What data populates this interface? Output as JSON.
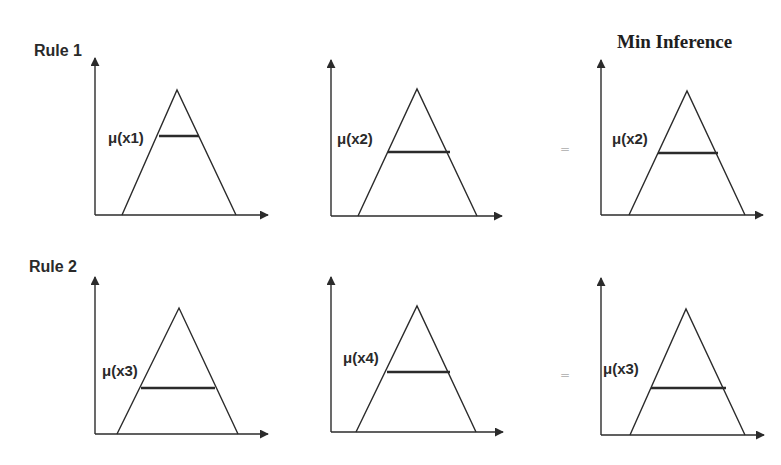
{
  "title": "Min Inference",
  "rules": [
    {
      "label": "Rule 1",
      "panels": [
        {
          "mu_label": "μ(x1)"
        },
        {
          "mu_label": "μ(x2)"
        },
        {
          "mu_label": "μ(x2)",
          "role": "result"
        }
      ],
      "equals": "="
    },
    {
      "label": "Rule 2",
      "panels": [
        {
          "mu_label": "μ(x3)"
        },
        {
          "mu_label": "μ(x4)"
        },
        {
          "mu_label": "μ(x3)",
          "role": "result"
        }
      ],
      "equals": "="
    }
  ],
  "colors": {
    "line": "#2b2b2b",
    "equals": "#b8b8b8"
  }
}
